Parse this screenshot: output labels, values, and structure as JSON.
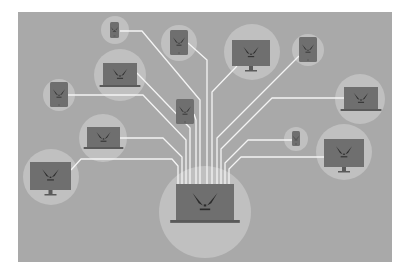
{
  "illustration": {
    "subject": "central laptop networked to many devices",
    "colors": {
      "page_bg": "#ffffff",
      "panel_bg": "#a9a9a9",
      "halo": "#c0c0c0",
      "device": "#6f6f6f",
      "device_edge": "#5a5a5a",
      "face": "#2b2b2b",
      "wire": "#f4f4f4"
    },
    "panel": {
      "x": 18,
      "y": 12,
      "w": 374,
      "h": 250
    },
    "hub": {
      "type": "laptop",
      "x": 176,
      "y": 184,
      "w": 58,
      "h": 36,
      "halo": {
        "cx": 205,
        "cy": 212,
        "r": 46
      }
    },
    "devices": [
      {
        "type": "phone",
        "x": 110,
        "y": 22,
        "w": 9,
        "h": 16,
        "halo": {
          "cx": 115,
          "cy": 30,
          "r": 14
        }
      },
      {
        "type": "tablet",
        "x": 170,
        "y": 30,
        "w": 18,
        "h": 25,
        "halo": {
          "cx": 179,
          "cy": 43,
          "r": 18
        }
      },
      {
        "type": "monitor",
        "x": 232,
        "y": 40,
        "w": 38,
        "h": 26,
        "halo": {
          "cx": 252,
          "cy": 52,
          "r": 28
        }
      },
      {
        "type": "tablet",
        "x": 299,
        "y": 37,
        "w": 18,
        "h": 25,
        "halo": {
          "cx": 308,
          "cy": 50,
          "r": 16
        }
      },
      {
        "type": "laptop",
        "x": 103,
        "y": 63,
        "w": 34,
        "h": 22,
        "halo": {
          "cx": 120,
          "cy": 75,
          "r": 26
        }
      },
      {
        "type": "tablet",
        "x": 50,
        "y": 82,
        "w": 18,
        "h": 25,
        "halo": {
          "cx": 59,
          "cy": 95,
          "r": 16
        }
      },
      {
        "type": "tablet",
        "x": 176,
        "y": 99,
        "w": 18,
        "h": 25,
        "halo": {
          "cx": 185,
          "cy": 111,
          "r": 0
        }
      },
      {
        "type": "laptop",
        "x": 344,
        "y": 87,
        "w": 34,
        "h": 22,
        "halo": {
          "cx": 360,
          "cy": 99,
          "r": 25
        }
      },
      {
        "type": "laptop",
        "x": 87,
        "y": 127,
        "w": 33,
        "h": 20,
        "halo": {
          "cx": 103,
          "cy": 138,
          "r": 24
        }
      },
      {
        "type": "phone",
        "x": 292,
        "y": 131,
        "w": 8,
        "h": 15,
        "halo": {
          "cx": 296,
          "cy": 139,
          "r": 12
        }
      },
      {
        "type": "monitor",
        "x": 324,
        "y": 139,
        "w": 40,
        "h": 28,
        "halo": {
          "cx": 344,
          "cy": 152,
          "r": 28
        }
      },
      {
        "type": "monitor",
        "x": 30,
        "y": 162,
        "w": 41,
        "h": 28,
        "halo": {
          "cx": 51,
          "cy": 177,
          "r": 28
        }
      }
    ],
    "wires": [
      "M120 31 L142 31 L200 100 L200 184",
      "M188 43 L207 60 L207 184",
      "M237 66 L212 92 L212 184",
      "M299 56 L217 138 L217 184",
      "M137 73 L190 128 L190 184",
      "M68 95 L143 95 L186 140 L186 184",
      "M194 114 L196 120 L196 184",
      "M344 98 L272 98 L221 149 L221 184",
      "M120 138 L163 138 L182 157 L182 184",
      "M292 140 L248 140 L225 163 L225 184",
      "M324 157 L241 157 L229 169 L229 184",
      "M71 170 L81 159 L172 159 L178 166 L178 184"
    ]
  }
}
